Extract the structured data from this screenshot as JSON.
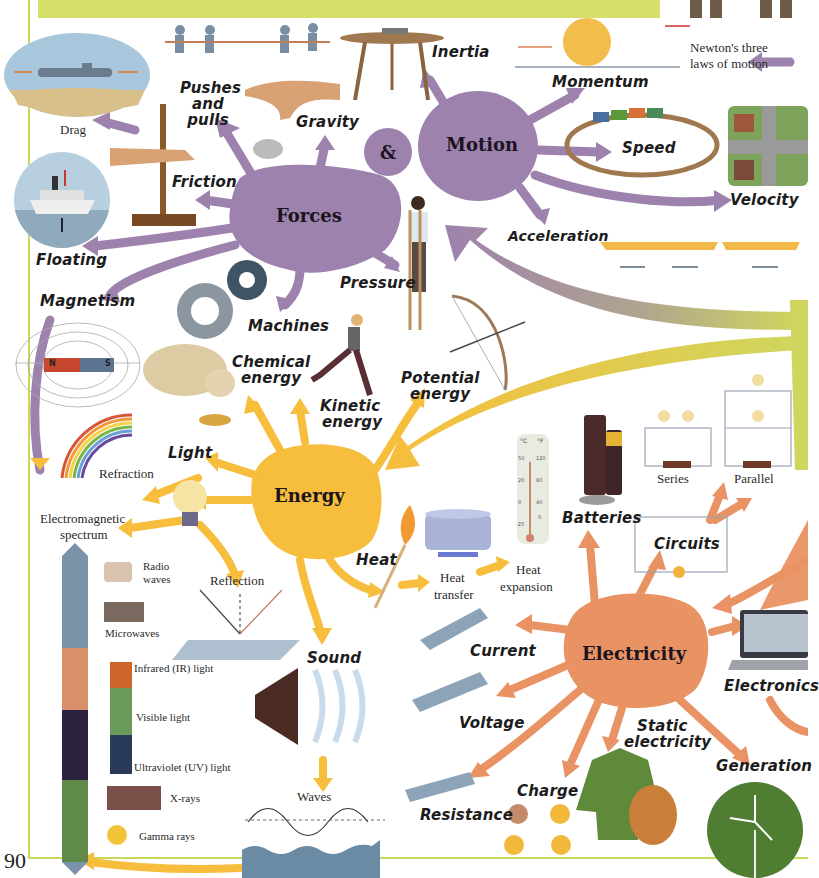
{
  "page": {
    "number": "90"
  },
  "colors": {
    "forces_purple": "#9d82ad",
    "energy_yellow": "#f7bd3c",
    "electricity_orange": "#e99263",
    "banner_green": "#d6df6a",
    "border_green": "#c9d85a"
  },
  "hubs": {
    "forces": "Forces",
    "ampersand": "&",
    "motion": "Motion",
    "energy": "Energy",
    "electricity": "Electricity"
  },
  "forces": {
    "pushes_pulls": "Pushes and pulls",
    "gravity": "Gravity",
    "friction": "Friction",
    "drag": "Drag",
    "floating": "Floating",
    "magnetism": "Magnetism",
    "machines": "Machines",
    "pressure": "Pressure"
  },
  "motion": {
    "inertia": "Inertia",
    "momentum": "Momentum",
    "newtons_laws_line1": "Newton's three",
    "newtons_laws_line2": "laws of motion",
    "speed": "Speed",
    "velocity": "Velocity",
    "acceleration": "Acceleration"
  },
  "energy": {
    "chemical_line1": "Chemical",
    "chemical_line2": "energy",
    "kinetic_line1": "Kinetic",
    "kinetic_line2": "energy",
    "potential_line1": "Potential",
    "potential_line2": "energy",
    "light": "Light",
    "refraction": "Refraction",
    "em_spectrum_line1": "Electromagnetic",
    "em_spectrum_line2": "spectrum",
    "reflection": "Reflection",
    "heat": "Heat",
    "heat_transfer_line1": "Heat",
    "heat_transfer_line2": "transfer",
    "heat_expansion_line1": "Heat",
    "heat_expansion_line2": "expansion",
    "sound": "Sound",
    "waves": "Waves"
  },
  "spectrum": {
    "radio_line1": "Radio",
    "radio_line2": "waves",
    "microwaves": "Microwaves",
    "infrared": "Infrared (IR) light",
    "visible": "Visible light",
    "ultraviolet": "Ultraviolet (UV) light",
    "xrays": "X-rays",
    "gamma": "Gamma rays"
  },
  "thermometer": {
    "c_label": "°C",
    "f_label": "°F",
    "c_ticks": [
      "50",
      "20",
      "0",
      "-25"
    ],
    "f_ticks": [
      "120",
      "80",
      "40",
      "0"
    ]
  },
  "magnet": {
    "north": "N",
    "south": "S"
  },
  "battery": {
    "label_aa": "AA",
    "label_aaa": "AAA"
  },
  "electricity": {
    "batteries": "Batteries",
    "series": "Series",
    "parallel": "Parallel",
    "circuits": "Circuits",
    "current": "Current",
    "voltage": "Voltage",
    "resistance": "Resistance",
    "charge": "Charge",
    "static_line1": "Static",
    "static_line2": "electricity",
    "generation": "Generation",
    "electronics": "Electronics"
  }
}
